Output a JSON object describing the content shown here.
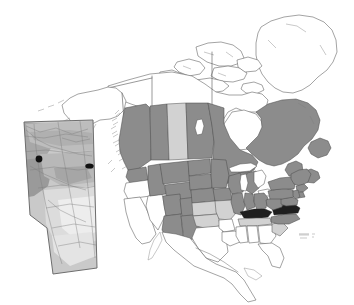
{
  "figure": {
    "name": "north-america-distribution-map",
    "type": "thematic-choropleth-map",
    "width": 354,
    "height": 305,
    "background_color": "#ffffff"
  },
  "colors": {
    "background": "#ffffff",
    "outline": "#4a4a4a",
    "outline_light": "#8e8e8e",
    "fill_absent": "#ffffff",
    "fill_light": "#d2d2d2",
    "fill_dark": "#8c8c8c",
    "fill_black": "#1a1a1a",
    "inset_border": "#6b6b6b",
    "inset_base": "#c9c9c9",
    "inset_mid": "#b4b4b4",
    "inset_darker": "#9c9c9c",
    "inset_light": "#dedede",
    "inset_lightest": "#efefef",
    "marker": "#111111"
  },
  "legend": {
    "shown": false,
    "classes": [
      {
        "key": "dark",
        "label": "Primary range",
        "color": "#8c8c8c"
      },
      {
        "key": "light",
        "label": "Secondary range",
        "color": "#d2d2d2"
      },
      {
        "key": "black",
        "label": "Core / highlighted area",
        "color": "#1a1a1a"
      },
      {
        "key": "absent",
        "label": "Absent",
        "color": "#ffffff"
      }
    ]
  },
  "inset": {
    "name": "alberta-inset",
    "title": "Alberta",
    "title_shown": false,
    "bounds": {
      "x": 12,
      "y": 118,
      "width": 88,
      "height": 158
    },
    "markers": [
      {
        "name": "marker-west",
        "shape": "circle",
        "x": 39,
        "y": 159,
        "r": 3.4
      },
      {
        "name": "marker-east",
        "shape": "ellipse",
        "x": 89.5,
        "y": 166,
        "rx": 4.2,
        "ry": 2.6
      }
    ]
  },
  "regions": {
    "dark_grey": [
      "British Columbia",
      "Alberta",
      "Manitoba",
      "Ontario",
      "Quebec",
      "Newfoundland and Labrador",
      "New Brunswick",
      "Nova Scotia",
      "Washington",
      "Idaho",
      "Montana",
      "North Dakota",
      "South Dakota",
      "Minnesota",
      "Wisconsin",
      "Michigan",
      "Wyoming",
      "Colorado",
      "Nebraska",
      "Iowa",
      "Illinois",
      "Indiana",
      "Ohio",
      "Pennsylvania",
      "New York",
      "Vermont",
      "New Hampshire",
      "Maine",
      "Massachusetts",
      "Connecticut",
      "Rhode Island",
      "New Jersey",
      "Maryland",
      "West Virginia",
      "Utah",
      "Arizona",
      "New Mexico",
      "North Carolina"
    ],
    "light_grey": [
      "Saskatchewan",
      "Yukon-part",
      "Missouri",
      "Kansas",
      "Oklahoma",
      "Tennessee-part",
      "South Carolina-part"
    ],
    "black": [
      "Kentucky",
      "Virginia"
    ],
    "white": [
      "Alaska",
      "Greenland",
      "Nunavut",
      "Northwest Territories",
      "Yukon",
      "California",
      "Oregon",
      "Nevada",
      "Texas",
      "Louisiana",
      "Arkansas",
      "Mississippi",
      "Alabama",
      "Georgia",
      "Florida",
      "Mexico",
      "Cuba",
      "Bahamas",
      "Delaware"
    ]
  },
  "water_features": [
    "Lake Superior",
    "Lake Michigan",
    "Lake Huron",
    "Lake Erie",
    "Lake Ontario",
    "Hudson Bay",
    "Great Slave Lake",
    "Great Bear Lake",
    "Lake Winnipeg",
    "Gulf of Mexico",
    "Atlantic Ocean",
    "Pacific Ocean"
  ],
  "annotations": {
    "bermuda_marks": {
      "x": 303,
      "y": 236,
      "shown": true,
      "label": ""
    }
  }
}
